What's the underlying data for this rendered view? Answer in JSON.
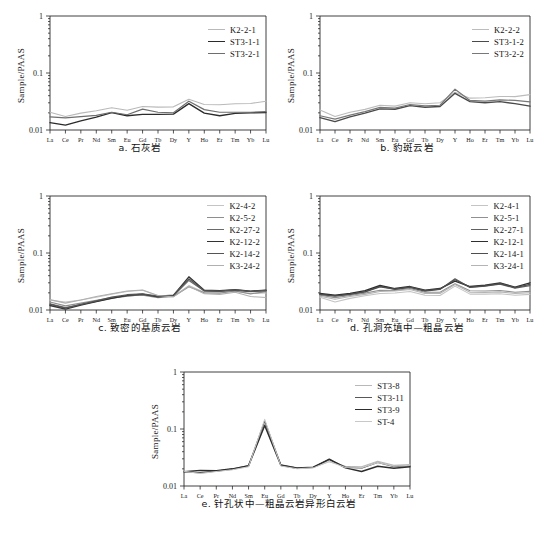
{
  "figure": {
    "axis": {
      "ylabel": "Sample/PAAS",
      "yticks": [
        "1",
        "0.1",
        "0.01"
      ],
      "ylim": [
        0.01,
        1
      ],
      "yscale": "log",
      "xcategories": [
        "La",
        "Ce",
        "Pr",
        "Nd",
        "Sm",
        "Eu",
        "Gd",
        "Tb",
        "Dy",
        "Y",
        "Ho",
        "Er",
        "Tm",
        "Yb",
        "Lu"
      ],
      "grid": false
    }
  },
  "chart_data": [
    {
      "id": "panel-a",
      "type": "line",
      "title": "a. 石灰岩",
      "caption": "a. 石灰岩",
      "xlabel": "",
      "ylabel": "Sample/PAAS",
      "yscale": "log",
      "ylim": [
        0.01,
        1
      ],
      "yticks": [
        1,
        0.1,
        0.01
      ],
      "categories": [
        "La",
        "Ce",
        "Pr",
        "Nd",
        "Sm",
        "Eu",
        "Gd",
        "Tb",
        "Dy",
        "Y",
        "Ho",
        "Er",
        "Tm",
        "Yb",
        "Lu"
      ],
      "legend_position": "top-right",
      "series": [
        {
          "name": "K2-2-1",
          "color": "#b9b9b9",
          "width": 1.1,
          "values": [
            0.0205,
            0.0173,
            0.0198,
            0.0218,
            0.0245,
            0.0222,
            0.0258,
            0.0252,
            0.0255,
            0.0345,
            0.028,
            0.0278,
            0.0288,
            0.0292,
            0.032
          ]
        },
        {
          "name": "ST3-1-1",
          "color": "#2b2b2b",
          "width": 1.35,
          "values": [
            0.0135,
            0.0122,
            0.0145,
            0.0168,
            0.0202,
            0.0178,
            0.0188,
            0.0188,
            0.019,
            0.029,
            0.0198,
            0.0178,
            0.0196,
            0.02,
            0.0202
          ]
        },
        {
          "name": "ST3-2-1",
          "color": "#6e6e6e",
          "width": 1.2,
          "values": [
            0.017,
            0.0163,
            0.0172,
            0.018,
            0.0205,
            0.0185,
            0.0232,
            0.0205,
            0.02,
            0.032,
            0.0228,
            0.0205,
            0.0205,
            0.0205,
            0.021
          ]
        }
      ]
    },
    {
      "id": "panel-b",
      "type": "line",
      "title": "b. 豹斑云岩",
      "caption": "b. 豹斑云岩",
      "xlabel": "",
      "ylabel": "Sample/PAAS",
      "yscale": "log",
      "ylim": [
        0.01,
        1
      ],
      "yticks": [
        1,
        0.1,
        0.01
      ],
      "categories": [
        "La",
        "Ce",
        "Pr",
        "Nd",
        "Sm",
        "Eu",
        "Gd",
        "Tb",
        "Dy",
        "Y",
        "Ho",
        "Er",
        "Tm",
        "Yb",
        "Lu"
      ],
      "legend_position": "top-right",
      "series": [
        {
          "name": "K2-2-2",
          "color": "#bcbcbc",
          "width": 1.1,
          "values": [
            0.0225,
            0.0172,
            0.0205,
            0.023,
            0.0272,
            0.0262,
            0.03,
            0.0288,
            0.03,
            0.046,
            0.0362,
            0.0368,
            0.0388,
            0.0385,
            0.0418
          ]
        },
        {
          "name": "ST3-1-2",
          "color": "#4a4a4a",
          "width": 1.45,
          "values": [
            0.0165,
            0.014,
            0.017,
            0.0198,
            0.0235,
            0.0232,
            0.0268,
            0.025,
            0.0258,
            0.044,
            0.0315,
            0.03,
            0.0315,
            0.029,
            0.0262
          ]
        },
        {
          "name": "ST3-2-2",
          "color": "#787878",
          "width": 1.2,
          "values": [
            0.0178,
            0.0155,
            0.0182,
            0.021,
            0.025,
            0.0242,
            0.028,
            0.0265,
            0.0272,
            0.052,
            0.033,
            0.0322,
            0.0338,
            0.033,
            0.0312
          ]
        }
      ]
    },
    {
      "id": "panel-c",
      "type": "line",
      "title": "c. 致密的基质云岩",
      "caption": "c. 致密的基质云岩",
      "xlabel": "",
      "ylabel": "Sample/PAAS",
      "yscale": "log",
      "ylim": [
        0.01,
        1
      ],
      "yticks": [
        1,
        0.1,
        0.01
      ],
      "categories": [
        "La",
        "Ce",
        "Pr",
        "Nd",
        "Sm",
        "Eu",
        "Gd",
        "Tb",
        "Dy",
        "Y",
        "Ho",
        "Er",
        "Tm",
        "Yb",
        "Lu"
      ],
      "legend_position": "top-right",
      "series": [
        {
          "name": "K2-4-2",
          "color": "#c4c4c4",
          "width": 1.05,
          "values": [
            0.0148,
            0.0138,
            0.015,
            0.0168,
            0.019,
            0.0212,
            0.0222,
            0.0178,
            0.0175,
            0.0268,
            0.0205,
            0.0205,
            0.0212,
            0.0195,
            0.0198
          ]
        },
        {
          "name": "K2-5-2",
          "color": "#8e8e8e",
          "width": 1.1,
          "values": [
            0.0138,
            0.0118,
            0.0132,
            0.0148,
            0.0165,
            0.0178,
            0.0182,
            0.0165,
            0.0172,
            0.0255,
            0.02,
            0.0198,
            0.0215,
            0.0192,
            0.021
          ]
        },
        {
          "name": "K2-27-2",
          "color": "#6a6a6a",
          "width": 1.2,
          "values": [
            0.0128,
            0.011,
            0.0125,
            0.0142,
            0.0162,
            0.0175,
            0.0185,
            0.0172,
            0.0178,
            0.033,
            0.0215,
            0.0212,
            0.022,
            0.021,
            0.0218
          ]
        },
        {
          "name": "K2-12-2",
          "color": "#333333",
          "width": 1.35,
          "values": [
            0.012,
            0.0104,
            0.0122,
            0.014,
            0.016,
            0.018,
            0.019,
            0.017,
            0.018,
            0.0382,
            0.0222,
            0.0218,
            0.0228,
            0.0215,
            0.0222
          ]
        },
        {
          "name": "K2-14-2",
          "color": "#555555",
          "width": 1.3,
          "values": [
            0.0125,
            0.0108,
            0.0126,
            0.0145,
            0.0168,
            0.0185,
            0.0192,
            0.0175,
            0.0182,
            0.0352,
            0.0218,
            0.0215,
            0.0225,
            0.0212,
            0.022
          ]
        },
        {
          "name": "K3-24-2",
          "color": "#b0b0b0",
          "width": 1.05,
          "values": [
            0.0152,
            0.0132,
            0.015,
            0.0172,
            0.0192,
            0.0215,
            0.0225,
            0.018,
            0.017,
            0.0262,
            0.0192,
            0.0188,
            0.0205,
            0.0172,
            0.0165
          ]
        }
      ]
    },
    {
      "id": "panel-d",
      "type": "line",
      "title": "d. 孔洞充填中—粗晶云岩",
      "caption": "d. 孔洞充填中—粗晶云岩",
      "xlabel": "",
      "ylabel": "Sample/PAAS",
      "yscale": "log",
      "ylim": [
        0.01,
        1
      ],
      "yticks": [
        1,
        0.1,
        0.01
      ],
      "categories": [
        "La",
        "Ce",
        "Pr",
        "Nd",
        "Sm",
        "Eu",
        "Gd",
        "Tb",
        "Dy",
        "Y",
        "Ho",
        "Er",
        "Tm",
        "Yb",
        "Lu"
      ],
      "legend_position": "top-right",
      "series": [
        {
          "name": "K2-4-1",
          "color": "#c4c4c4",
          "width": 1.05,
          "values": [
            0.0168,
            0.0138,
            0.016,
            0.0178,
            0.0195,
            0.0198,
            0.0212,
            0.0182,
            0.018,
            0.0262,
            0.019,
            0.019,
            0.0192,
            0.0182,
            0.0188
          ]
        },
        {
          "name": "K2-5-1",
          "color": "#909090",
          "width": 1.1,
          "values": [
            0.0182,
            0.0165,
            0.018,
            0.0198,
            0.0222,
            0.022,
            0.0238,
            0.0205,
            0.0205,
            0.0288,
            0.0218,
            0.0215,
            0.022,
            0.0205,
            0.0212
          ]
        },
        {
          "name": "K2-27-1",
          "color": "#606060",
          "width": 1.2,
          "values": [
            0.019,
            0.0178,
            0.019,
            0.021,
            0.0262,
            0.023,
            0.0248,
            0.0215,
            0.023,
            0.0352,
            0.0248,
            0.0262,
            0.0285,
            0.0242,
            0.0268
          ]
        },
        {
          "name": "K2-12-1",
          "color": "#2f2f2f",
          "width": 1.35,
          "values": [
            0.0195,
            0.0182,
            0.0196,
            0.0218,
            0.027,
            0.0238,
            0.0258,
            0.0222,
            0.0238,
            0.0322,
            0.0258,
            0.0272,
            0.0298,
            0.0252,
            0.03
          ]
        },
        {
          "name": "K2-14-1",
          "color": "#4e4e4e",
          "width": 1.25,
          "values": [
            0.0188,
            0.0175,
            0.0188,
            0.0208,
            0.0255,
            0.0232,
            0.0252,
            0.0218,
            0.0232,
            0.034,
            0.0252,
            0.0265,
            0.029,
            0.0248,
            0.0282
          ]
        },
        {
          "name": "K3-24-1",
          "color": "#b4b4b4",
          "width": 1.05,
          "values": [
            0.0175,
            0.0155,
            0.0172,
            0.0188,
            0.0212,
            0.0215,
            0.0228,
            0.0195,
            0.0195,
            0.028,
            0.0205,
            0.0202,
            0.0208,
            0.0195,
            0.02
          ]
        }
      ]
    },
    {
      "id": "panel-e",
      "type": "line",
      "title": "e. 针孔状中—粗晶云岩异形白云岩",
      "caption": "e. 针孔状中—粗晶云岩异形白云岩",
      "xlabel": "",
      "ylabel": "Sample/PAAS",
      "yscale": "log",
      "ylim": [
        0.01,
        1
      ],
      "yticks": [
        1,
        0.1,
        0.01
      ],
      "categories": [
        "La",
        "Ce",
        "Pr",
        "Nd",
        "Sm",
        "Eu",
        "Gd",
        "Tb",
        "Dy",
        "Y",
        "Ho",
        "Er",
        "Tm",
        "Yb",
        "Lu"
      ],
      "legend_position": "top-right",
      "series": [
        {
          "name": "ST3-8",
          "color": "#b8b8b8",
          "width": 1.1,
          "values": [
            0.018,
            0.0168,
            0.0182,
            0.0195,
            0.0222,
            0.12,
            0.023,
            0.0205,
            0.0212,
            0.0268,
            0.0222,
            0.0218,
            0.0272,
            0.023,
            0.0238
          ]
        },
        {
          "name": "ST3-11",
          "color": "#585858",
          "width": 1.2,
          "values": [
            0.0178,
            0.0172,
            0.0182,
            0.0198,
            0.0225,
            0.138,
            0.0235,
            0.0208,
            0.0215,
            0.029,
            0.0215,
            0.0205,
            0.0258,
            0.0218,
            0.0228
          ]
        },
        {
          "name": "ST3-9",
          "color": "#2d2d2d",
          "width": 1.45,
          "values": [
            0.0178,
            0.0188,
            0.0185,
            0.02,
            0.0228,
            0.115,
            0.0232,
            0.0205,
            0.0212,
            0.0295,
            0.0208,
            0.018,
            0.0222,
            0.0205,
            0.0218
          ]
        },
        {
          "name": "ST-4",
          "color": "#c8c8c8",
          "width": 1.05,
          "values": [
            0.0182,
            0.0165,
            0.018,
            0.0192,
            0.0218,
            0.148,
            0.0225,
            0.02,
            0.0208,
            0.0268,
            0.0212,
            0.0208,
            0.0258,
            0.0222,
            0.0232
          ]
        }
      ]
    }
  ]
}
